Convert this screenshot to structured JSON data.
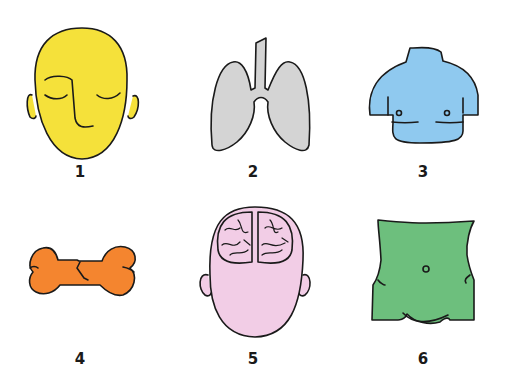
{
  "panels": [
    {
      "number": "1",
      "subject": "face",
      "color": "#f5e13a"
    },
    {
      "number": "2",
      "subject": "lungs",
      "color": "#d4d4d4"
    },
    {
      "number": "3",
      "subject": "chest",
      "color": "#8fc9ef"
    },
    {
      "number": "4",
      "subject": "broken bone",
      "color": "#f4852f"
    },
    {
      "number": "5",
      "subject": "brain in head",
      "color": "#f2cde6"
    },
    {
      "number": "6",
      "subject": "abdomen",
      "color": "#6dbf7d"
    }
  ]
}
